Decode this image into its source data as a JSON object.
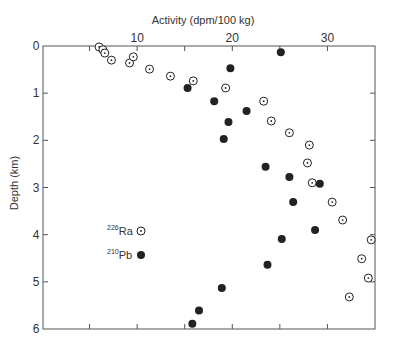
{
  "chart_data": {
    "type": "scatter",
    "title": "",
    "xlabel": "Activity (dpm/100 kg)",
    "ylabel": "Depth (km)",
    "x_axis_position": "top",
    "y_axis_inverted": true,
    "xlim": [
      0,
      35
    ],
    "ylim": [
      0,
      6
    ],
    "x_ticks": [
      5,
      10,
      15,
      20,
      25,
      30
    ],
    "x_tick_labels": [
      {
        "value": 10,
        "label": "10"
      },
      {
        "value": 20,
        "label": "20"
      },
      {
        "value": 30,
        "label": "30"
      }
    ],
    "y_ticks": [
      0,
      1,
      2,
      3,
      4,
      5,
      6
    ],
    "y_tick_labels": [
      "0",
      "1",
      "2",
      "3",
      "4",
      "5",
      "6"
    ],
    "grid": false,
    "legend_position": "inside-left-lower",
    "series": [
      {
        "name": "226Ra",
        "isotope_mass": "226",
        "element": "Ra",
        "marker": "circle-dot-open",
        "points": [
          [
            6.0,
            0.02
          ],
          [
            6.4,
            0.08
          ],
          [
            6.6,
            0.15
          ],
          [
            7.3,
            0.3
          ],
          [
            9.2,
            0.36
          ],
          [
            9.6,
            0.23
          ],
          [
            11.3,
            0.49
          ],
          [
            13.5,
            0.64
          ],
          [
            15.9,
            0.74
          ],
          [
            19.3,
            0.89
          ],
          [
            23.3,
            1.17
          ],
          [
            24.1,
            1.59
          ],
          [
            26.0,
            1.84
          ],
          [
            28.1,
            2.1
          ],
          [
            27.9,
            2.48
          ],
          [
            28.4,
            2.9
          ],
          [
            30.5,
            3.31
          ],
          [
            31.6,
            3.69
          ],
          [
            34.6,
            4.11
          ],
          [
            33.6,
            4.51
          ],
          [
            34.3,
            4.92
          ],
          [
            32.3,
            5.32
          ]
        ]
      },
      {
        "name": "210Pb",
        "isotope_mass": "210",
        "element": "Pb",
        "marker": "circle-filled",
        "points": [
          [
            25.1,
            0.13
          ],
          [
            19.8,
            0.47
          ],
          [
            15.3,
            0.89
          ],
          [
            18.1,
            1.17
          ],
          [
            21.5,
            1.38
          ],
          [
            19.6,
            1.61
          ],
          [
            19.1,
            1.97
          ],
          [
            23.5,
            2.56
          ],
          [
            26.0,
            2.78
          ],
          [
            29.2,
            2.92
          ],
          [
            26.4,
            3.31
          ],
          [
            28.7,
            3.9
          ],
          [
            25.2,
            4.09
          ],
          [
            23.7,
            4.64
          ],
          [
            18.9,
            5.13
          ],
          [
            16.5,
            5.61
          ],
          [
            15.8,
            5.89
          ]
        ]
      }
    ]
  },
  "colors": {
    "axis": "#555555",
    "text": "#333333",
    "marker": "#222222",
    "background": "#ffffff"
  }
}
